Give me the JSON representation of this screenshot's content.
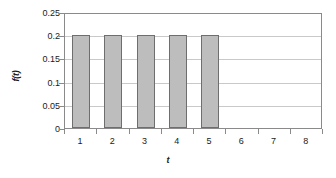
{
  "chart_data": {
    "type": "bar",
    "title": "",
    "subtitle": "",
    "xlabel": "t",
    "ylabel": "f(t)",
    "categories": [
      "1",
      "2",
      "3",
      "4",
      "5",
      "6",
      "7",
      "8"
    ],
    "values": [
      0.2,
      0.2,
      0.2,
      0.2,
      0.2,
      0,
      0,
      0
    ],
    "series": [
      {
        "name": "f(t)",
        "values": [
          0.2,
          0.2,
          0.2,
          0.2,
          0.2,
          0,
          0,
          0
        ]
      }
    ],
    "ylim": [
      0,
      0.25
    ],
    "ytick_values": [
      0,
      0.05,
      0.1,
      0.15,
      0.2,
      0.25
    ],
    "ytick_labels": [
      "0",
      "0.05",
      "0.1",
      "0.15",
      "0.2",
      "0.25"
    ],
    "xtick_labels": [
      "1",
      "2",
      "3",
      "4",
      "5",
      "6",
      "7",
      "8"
    ],
    "grid": "horizontal",
    "legend": "none",
    "annotations": [],
    "colors": {
      "bar_fill": "#bdbdbd",
      "bar_border": "#6e6e6e",
      "gridline": "#c9c9c9",
      "frame": "#8a8a8a",
      "text": "#1a1a1a",
      "background": "#ffffff"
    }
  }
}
